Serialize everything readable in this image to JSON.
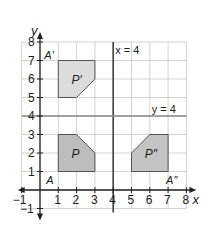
{
  "figure": {
    "type": "coordinate-plane-reflection",
    "axes": {
      "x_label": "x",
      "y_label": "y",
      "x_ticks": [
        "−1",
        "1",
        "2",
        "3",
        "4",
        "5",
        "6",
        "7",
        "8"
      ],
      "y_ticks": [
        "−1",
        "1",
        "2",
        "3",
        "4",
        "5",
        "6",
        "7",
        "8"
      ],
      "x_range": [
        -1,
        8
      ],
      "y_range": [
        -1,
        8
      ],
      "grid": true
    },
    "lines": [
      {
        "name": "vertical-line",
        "label": "x = 4",
        "equation": "x=4"
      },
      {
        "name": "horizontal-line",
        "label": "y = 4",
        "equation": "y=4"
      }
    ],
    "shapes": [
      {
        "name": "P",
        "label": "P",
        "fill": "#bdbdbd",
        "points": [
          [
            1,
            1
          ],
          [
            3,
            1
          ],
          [
            3,
            2
          ],
          [
            2,
            3
          ],
          [
            1,
            3
          ]
        ],
        "vertex_label": "A",
        "vertex": [
          1,
          1
        ]
      },
      {
        "name": "P-prime",
        "label": "P′",
        "fill": "#dcdcdc",
        "points": [
          [
            1,
            7
          ],
          [
            3,
            7
          ],
          [
            3,
            6
          ],
          [
            2,
            5
          ],
          [
            1,
            5
          ]
        ],
        "vertex_label": "A′",
        "vertex": [
          1,
          7
        ]
      },
      {
        "name": "P-double-prime",
        "label": "P″",
        "fill": "#c4c4c4",
        "points": [
          [
            7,
            1
          ],
          [
            5,
            1
          ],
          [
            5,
            2
          ],
          [
            6,
            3
          ],
          [
            7,
            3
          ]
        ],
        "vertex_label": "A″",
        "vertex": [
          7,
          1
        ]
      }
    ],
    "colors": {
      "grid": "#c8c8c8",
      "axis": "#222222",
      "reflection_line": "#444444",
      "shape_stroke": "#555555"
    }
  }
}
